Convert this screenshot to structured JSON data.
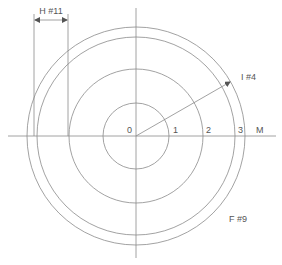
{
  "diagram": {
    "center": {
      "x": 136,
      "y": 136
    },
    "stroke_color": "#8a8a8a",
    "text_color": "#555555",
    "axis_labels": {
      "origin": "0",
      "tick1": "1",
      "tick2": "2",
      "tick3": "3",
      "axis_end": "M"
    },
    "circles": [
      {
        "name": "circle-1",
        "r": 33
      },
      {
        "name": "circle-2",
        "r": 67
      },
      {
        "name": "circle-3",
        "r": 99
      },
      {
        "name": "circle-4",
        "r": 109
      }
    ],
    "dimension_h": {
      "label": "H #11",
      "x1": 34,
      "x2": 68,
      "y": 20
    },
    "radius_arrow": {
      "label": "I #4",
      "x2": 230,
      "y2": 82
    },
    "region_label": {
      "label": "F #9"
    }
  }
}
